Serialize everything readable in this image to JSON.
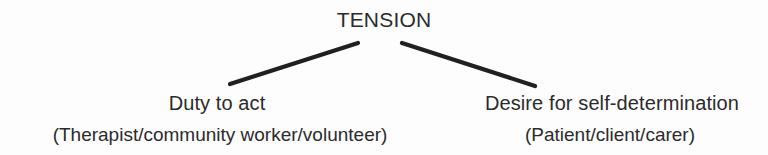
{
  "diagram": {
    "type": "tree",
    "title": "TENSION",
    "background_color": "#fdfdfd",
    "text_color": "#2b2b2b",
    "line_color": "#22201f",
    "root": {
      "label": "TENSION"
    },
    "branches": [
      {
        "id": "left",
        "label": "Duty to act",
        "sublabel": "(Therapist/community worker/volunteer)",
        "connector": {
          "name": "left-connector-line",
          "x1": 358,
          "y1": 43,
          "x2": 230,
          "y2": 84,
          "stroke_width": 4.2
        }
      },
      {
        "id": "right",
        "label": "Desire for self-determination",
        "sublabel": "(Patient/client/carer)",
        "connector": {
          "name": "right-connector-line",
          "x1": 402,
          "y1": 43,
          "x2": 535,
          "y2": 86,
          "stroke_width": 4.2
        }
      }
    ]
  }
}
